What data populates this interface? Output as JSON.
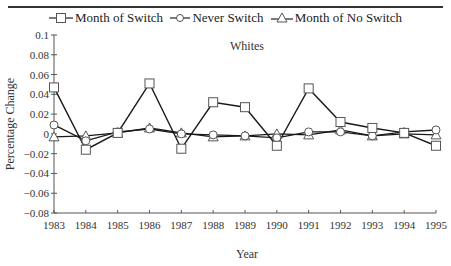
{
  "legend": {
    "items": [
      {
        "label": "Month of Switch",
        "marker": "square"
      },
      {
        "label": "Never Switch",
        "marker": "circle"
      },
      {
        "label": "Month of No Switch",
        "marker": "triangle"
      }
    ]
  },
  "chart_data": {
    "type": "line",
    "title": "Whites",
    "xlabel": "Year",
    "ylabel": "Percentage Change",
    "x": [
      1983,
      1984,
      1985,
      1986,
      1987,
      1988,
      1989,
      1990,
      1991,
      1992,
      1993,
      1994,
      1995
    ],
    "x_tick_labels": [
      "1983",
      "1984",
      "1985",
      "1986",
      "1987",
      "1988",
      "1989",
      "1990",
      "1991",
      "1992",
      "1993",
      "1994",
      "1995"
    ],
    "y_tick_labels": [
      "0.1",
      "0.08",
      "0.06",
      "0.04",
      "0.02",
      "0",
      "−0.02",
      "−0.04",
      "−0.06",
      "−0.08"
    ],
    "y_ticks": [
      0.1,
      0.08,
      0.06,
      0.04,
      0.02,
      0,
      -0.02,
      -0.04,
      -0.06,
      -0.08
    ],
    "ylim": [
      -0.08,
      0.1
    ],
    "grid": false,
    "legend_position": "top",
    "series": [
      {
        "name": "Month of Switch",
        "marker": "square",
        "values": [
          0.047,
          -0.016,
          0.001,
          0.051,
          -0.015,
          0.032,
          0.027,
          -0.012,
          0.046,
          0.012,
          0.006,
          0.001,
          -0.012
        ]
      },
      {
        "name": "Never Switch",
        "marker": "circle",
        "values": [
          0.009,
          -0.007,
          0.002,
          0.005,
          0.0,
          -0.001,
          -0.002,
          -0.004,
          0.002,
          0.002,
          -0.002,
          0.002,
          0.004
        ]
      },
      {
        "name": "Month of No Switch",
        "marker": "triangle",
        "values": [
          -0.003,
          -0.002,
          0.001,
          0.006,
          0.001,
          -0.003,
          -0.002,
          0.0,
          -0.001,
          0.004,
          -0.002,
          0.0,
          -0.001
        ]
      }
    ]
  }
}
